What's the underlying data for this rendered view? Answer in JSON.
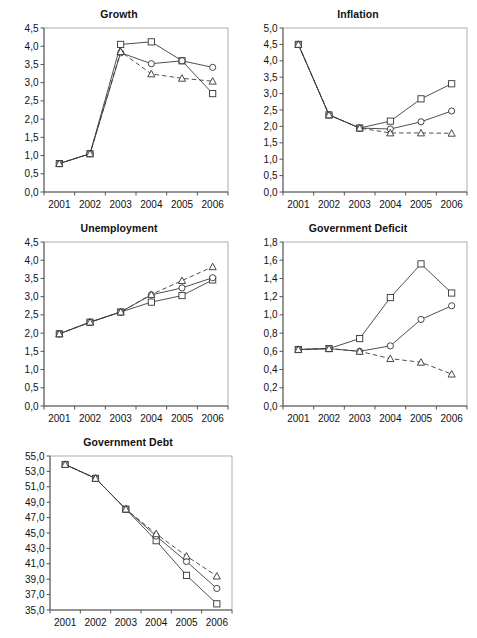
{
  "figure": {
    "background": "#ffffff",
    "series_names": [
      "square-series",
      "circle-series",
      "triangle-series"
    ],
    "years": [
      "2001",
      "2002",
      "2003",
      "2004",
      "2005",
      "2006"
    ],
    "footnote": ""
  },
  "chart_data": [
    {
      "id": "growth",
      "type": "line",
      "title": "Growth",
      "xlabel": "",
      "ylabel": "",
      "categories": [
        "2001",
        "2002",
        "2003",
        "2004",
        "2005",
        "2006"
      ],
      "ylim": [
        0.0,
        4.5
      ],
      "ytick_step": 0.5,
      "ytick_labels": [
        "0,0",
        "0,5",
        "1,0",
        "1,5",
        "2,0",
        "2,5",
        "3,0",
        "3,5",
        "4,0",
        "4,5"
      ],
      "grid": false,
      "legend": "none",
      "series": [
        {
          "name": "square-series",
          "marker": "square",
          "linestyle": "solid",
          "values": [
            0.78,
            1.05,
            4.05,
            4.12,
            3.6,
            2.7
          ]
        },
        {
          "name": "circle-series",
          "marker": "circle",
          "linestyle": "solid",
          "values": [
            0.78,
            1.05,
            3.82,
            3.52,
            3.6,
            3.42
          ]
        },
        {
          "name": "triangle-series",
          "marker": "triangle",
          "linestyle": "dashed",
          "values": [
            0.78,
            1.05,
            3.85,
            3.24,
            3.12,
            3.04
          ]
        }
      ]
    },
    {
      "id": "inflation",
      "type": "line",
      "title": "Inflation",
      "xlabel": "",
      "ylabel": "",
      "categories": [
        "2001",
        "2002",
        "2003",
        "2004",
        "2005",
        "2006"
      ],
      "ylim": [
        0.0,
        5.0
      ],
      "ytick_step": 0.5,
      "ytick_labels": [
        "0,0",
        "0,5",
        "1,0",
        "1,5",
        "2,0",
        "2,5",
        "3,0",
        "3,5",
        "4,0",
        "4,5",
        "5,0"
      ],
      "grid": false,
      "legend": "none",
      "series": [
        {
          "name": "square-series",
          "marker": "square",
          "linestyle": "solid",
          "values": [
            4.5,
            2.35,
            1.95,
            2.16,
            2.84,
            3.3
          ]
        },
        {
          "name": "circle-series",
          "marker": "circle",
          "linestyle": "solid",
          "values": [
            4.5,
            2.35,
            1.95,
            1.92,
            2.14,
            2.47
          ]
        },
        {
          "name": "triangle-series",
          "marker": "triangle",
          "linestyle": "dashed",
          "values": [
            4.5,
            2.35,
            1.95,
            1.8,
            1.8,
            1.79
          ]
        }
      ]
    },
    {
      "id": "unemployment",
      "type": "line",
      "title": "Unemployment",
      "xlabel": "",
      "ylabel": "",
      "categories": [
        "2001",
        "2002",
        "2003",
        "2004",
        "2005",
        "2006"
      ],
      "ylim": [
        0.0,
        4.5
      ],
      "ytick_step": 0.5,
      "ytick_labels": [
        "0,0",
        "0,5",
        "1,0",
        "1,5",
        "2,0",
        "2,5",
        "3,0",
        "3,5",
        "4,0",
        "4,5"
      ],
      "grid": false,
      "legend": "none",
      "series": [
        {
          "name": "square-series",
          "marker": "square",
          "linestyle": "solid",
          "values": [
            1.98,
            2.3,
            2.58,
            2.85,
            3.03,
            3.46
          ]
        },
        {
          "name": "circle-series",
          "marker": "circle",
          "linestyle": "solid",
          "values": [
            1.98,
            2.3,
            2.58,
            3.05,
            3.24,
            3.52
          ]
        },
        {
          "name": "triangle-series",
          "marker": "triangle",
          "linestyle": "dashed",
          "values": [
            1.98,
            2.3,
            2.58,
            3.06,
            3.44,
            3.82
          ]
        }
      ]
    },
    {
      "id": "government-deficit",
      "type": "line",
      "title": "Government Deficit",
      "xlabel": "",
      "ylabel": "",
      "categories": [
        "2001",
        "2002",
        "2003",
        "2004",
        "2005",
        "2006"
      ],
      "ylim": [
        0.0,
        1.8
      ],
      "ytick_step": 0.2,
      "ytick_labels": [
        "0,0",
        "0,2",
        "0,4",
        "0,6",
        "0,8",
        "1,0",
        "1,2",
        "1,4",
        "1,6",
        "1,8"
      ],
      "grid": false,
      "legend": "none",
      "series": [
        {
          "name": "square-series",
          "marker": "square",
          "linestyle": "solid",
          "values": [
            0.62,
            0.63,
            0.74,
            1.19,
            1.56,
            1.24
          ]
        },
        {
          "name": "circle-series",
          "marker": "circle",
          "linestyle": "solid",
          "values": [
            0.62,
            0.63,
            0.6,
            0.66,
            0.95,
            1.1
          ]
        },
        {
          "name": "triangle-series",
          "marker": "triangle",
          "linestyle": "dashed",
          "values": [
            0.62,
            0.63,
            0.6,
            0.52,
            0.48,
            0.35
          ]
        }
      ]
    },
    {
      "id": "government-debt",
      "type": "line",
      "title": "Government Debt",
      "xlabel": "",
      "ylabel": "",
      "categories": [
        "2001",
        "2002",
        "2003",
        "2004",
        "2005",
        "2006"
      ],
      "ylim": [
        35.0,
        55.0
      ],
      "ytick_step": 2.0,
      "ytick_labels": [
        "35,0",
        "37,0",
        "39,0",
        "41,0",
        "43,0",
        "45,0",
        "47,0",
        "49,0",
        "51,0",
        "53,0",
        "55,0"
      ],
      "grid": false,
      "legend": "none",
      "series": [
        {
          "name": "square-series",
          "marker": "square",
          "linestyle": "solid",
          "values": [
            53.9,
            52.1,
            48.1,
            44.0,
            39.5,
            35.8
          ]
        },
        {
          "name": "circle-series",
          "marker": "circle",
          "linestyle": "solid",
          "values": [
            53.9,
            52.1,
            48.1,
            44.6,
            41.3,
            37.8
          ]
        },
        {
          "name": "triangle-series",
          "marker": "triangle",
          "linestyle": "dashed",
          "values": [
            53.9,
            52.1,
            48.1,
            44.9,
            42.0,
            39.4
          ]
        }
      ]
    }
  ]
}
